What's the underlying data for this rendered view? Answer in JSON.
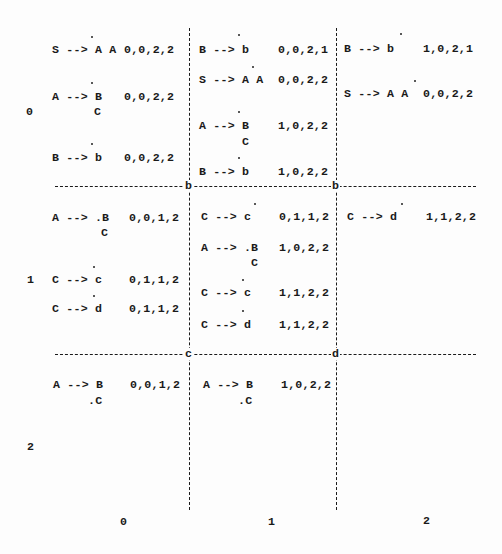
{
  "row_labels": [
    "0",
    "1",
    "2"
  ],
  "col_labels": [
    "0",
    "1",
    "2"
  ],
  "grid_nodes": {
    "top_left": "b",
    "top_right": "b",
    "bottom_left": "c",
    "bottom_right": "d"
  },
  "cells": {
    "r0c0": [
      {
        "rule": "S --> A A",
        "span": "0,0,2,2",
        "dot_after": "S --> "
      },
      {
        "rule": "A --> B",
        "rule2": "C",
        "span": "0,0,2,2",
        "dot_after": "A --> "
      },
      {
        "rule": "B --> b",
        "span": "0,0,2,2",
        "dot_after": "B --> "
      }
    ],
    "r0c1": [
      {
        "rule": "B --> b",
        "span": "0,0,2,1",
        "dot_after": "B --> "
      },
      {
        "rule": "S --> A A",
        "span": "0,0,2,2",
        "dot_after": "S --> A"
      },
      {
        "rule": "A --> B",
        "rule2": "C",
        "span": "1,0,2,2",
        "dot_after": "A --> "
      },
      {
        "rule": "B --> b",
        "span": "1,0,2,2",
        "dot_after": "B --> "
      }
    ],
    "r0c2": [
      {
        "rule": "B --> b",
        "span": "1,0,2,1",
        "dot_after": "B --> b"
      },
      {
        "rule": "S --> A A",
        "span": "0,0,2,2",
        "dot_after": "S --> A A"
      }
    ],
    "r1c0": [
      {
        "rule": "A --> .B",
        "rule2": "C",
        "span": "0,0,1,2"
      },
      {
        "rule": "C --> c",
        "span": "0,1,1,2",
        "dot_after": "C --> "
      },
      {
        "rule": "C --> d",
        "span": "0,1,1,2",
        "dot_after": "C --> "
      }
    ],
    "r1c1": [
      {
        "rule": "C --> c",
        "span": "0,1,1,2",
        "dot_after": "C --> c"
      },
      {
        "rule": "A --> .B",
        "rule2": "C",
        "span": "1,0,2,2"
      },
      {
        "rule": "C --> c",
        "span": "1,1,2,2",
        "dot_after": "C --> "
      },
      {
        "rule": "C --> d",
        "span": "1,1,2,2",
        "dot_after": "C --> "
      }
    ],
    "r1c2": [
      {
        "rule": "C --> d",
        "span": "1,1,2,2",
        "dot_after": "C --> d"
      }
    ],
    "r2c0": [
      {
        "rule": "A --> B",
        "rule2": ".C",
        "span": "0,0,1,2"
      }
    ],
    "r2c1": [
      {
        "rule": "A --> B",
        "rule2": ".C",
        "span": "1,0,2,2"
      }
    ],
    "r2c2": []
  },
  "colors": {
    "ink": "#1a1a1a",
    "paper": "#fdfdfd"
  }
}
